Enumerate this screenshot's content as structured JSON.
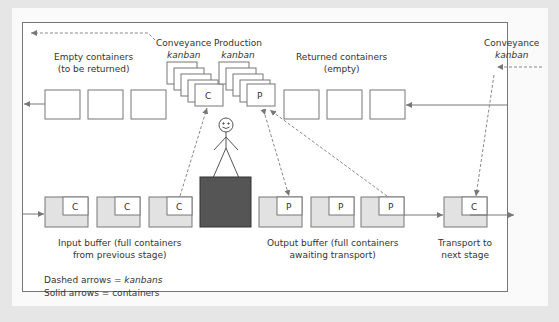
{
  "diagram": {
    "type": "kanban-flow",
    "labels": {
      "empty_containers": [
        "Empty containers",
        "(to be returned)"
      ],
      "conveyance_kanban_top": {
        "line1": "Conveyance",
        "line2": "kanban"
      },
      "production_kanban": {
        "line1": "Production",
        "line2": "kanban"
      },
      "returned_containers": [
        "Returned containers",
        "(empty)"
      ],
      "conveyance_kanban_right": {
        "line1": "Conveyance",
        "line2": "kanban"
      },
      "input_buffer": [
        "Input buffer (full containers",
        "from previous stage)"
      ],
      "output_buffer": [
        "Output buffer (full containers",
        "awaiting transport)"
      ],
      "transport": [
        "Transport to",
        "next stage"
      ]
    },
    "legend": {
      "dashed": {
        "prefix": "Dashed arrows = ",
        "term": "kanbans"
      },
      "solid": {
        "text": "Solid arrows = containers"
      }
    },
    "box_letters": {
      "conveyance": "C",
      "production": "P"
    },
    "colors": {
      "frame": "#777777",
      "box_fill_full": "#e2e2e2",
      "workstation": "#555555",
      "arrow": "#777777"
    },
    "nodes": [
      {
        "id": "empty-1",
        "kind": "empty-container"
      },
      {
        "id": "empty-2",
        "kind": "empty-container"
      },
      {
        "id": "empty-3",
        "kind": "empty-container"
      },
      {
        "id": "conveyance-kanban-stack",
        "kind": "kanban-stack",
        "letter": "C"
      },
      {
        "id": "production-kanban-stack",
        "kind": "kanban-stack",
        "letter": "P"
      },
      {
        "id": "returned-1",
        "kind": "empty-container"
      },
      {
        "id": "returned-2",
        "kind": "empty-container"
      },
      {
        "id": "returned-3",
        "kind": "empty-container"
      },
      {
        "id": "worker",
        "kind": "stick-figure"
      },
      {
        "id": "workstation",
        "kind": "process-block"
      },
      {
        "id": "input-1",
        "kind": "full-container",
        "letter": "C"
      },
      {
        "id": "input-2",
        "kind": "full-container",
        "letter": "C"
      },
      {
        "id": "input-3",
        "kind": "full-container",
        "letter": "C"
      },
      {
        "id": "output-1",
        "kind": "full-container",
        "letter": "P"
      },
      {
        "id": "output-2",
        "kind": "full-container",
        "letter": "P"
      },
      {
        "id": "output-3",
        "kind": "full-container",
        "letter": "P"
      },
      {
        "id": "transport-1",
        "kind": "full-container",
        "letter": "C"
      }
    ]
  }
}
